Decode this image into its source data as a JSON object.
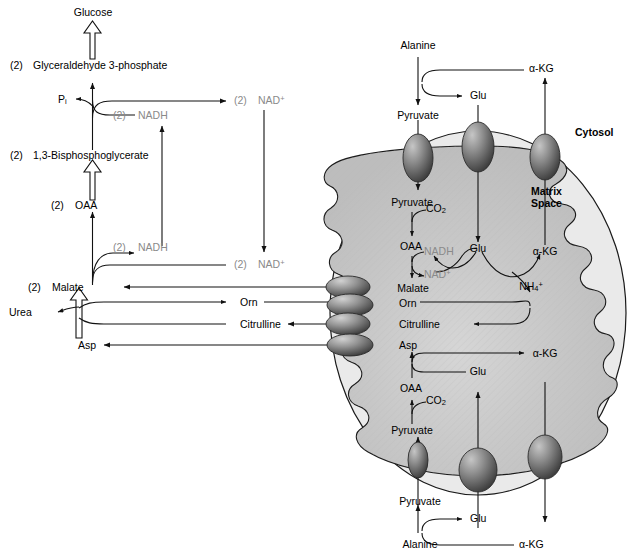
{
  "diagram": {
    "compartments": {
      "cytosol_label": "Cytosol",
      "matrix_label_line1": "Matrix",
      "matrix_label_line2": "Space"
    },
    "colors": {
      "outline": "#1a1a1a",
      "outer_membrane_fill": "#e8e8e8",
      "matrix_fill": "#c9c9c9",
      "transporter_dark": "#4a4a4a",
      "transporter_light": "#d8d8d8",
      "cofactor_gray": "#8a8a8a",
      "text": "#000000",
      "background": "#ffffff"
    },
    "stoich_prefix": "(2)",
    "cytosol_pathway": {
      "name": "Gluconeogenesis",
      "metabolites": [
        {
          "id": "glucose",
          "label": "Glucose"
        },
        {
          "id": "gap",
          "label": "Glyceraldehyde 3-phosphate",
          "prefix": "(2)"
        },
        {
          "id": "bpg",
          "label": "1,3-Bisphosphoglycerate",
          "prefix": "(2)"
        },
        {
          "id": "oaa_cyt",
          "label": "OAA",
          "prefix": "(2)"
        },
        {
          "id": "malate_cyt",
          "label": "Malate",
          "prefix": "(2)"
        },
        {
          "id": "asp_cyt",
          "label": "Asp"
        },
        {
          "id": "urea",
          "label": "Urea"
        },
        {
          "id": "orn_cyt",
          "label": "Orn"
        },
        {
          "id": "citr_cyt",
          "label": "Citrulline"
        }
      ],
      "cofactors": [
        {
          "id": "pi",
          "label": "P",
          "subscript": "i"
        },
        {
          "id": "nadh_top",
          "label": "NADH",
          "prefix": "(2)",
          "color": "gray"
        },
        {
          "id": "nad_top",
          "label": "NAD",
          "superscript": "+",
          "prefix": "(2)",
          "color": "gray"
        },
        {
          "id": "nadh_bot",
          "label": "NADH",
          "prefix": "(2)",
          "color": "gray"
        },
        {
          "id": "nad_bot",
          "label": "NAD",
          "superscript": "+",
          "prefix": "(2)",
          "color": "gray"
        }
      ]
    },
    "cytosol_right": {
      "top": [
        {
          "id": "alanine_top",
          "label": "Alanine"
        },
        {
          "id": "pyruvate_top_cyt",
          "label": "Pyruvate"
        },
        {
          "id": "glu_top_cyt",
          "label": "Glu"
        },
        {
          "id": "akg_top_cyt",
          "label": "α-KG"
        }
      ],
      "bottom": [
        {
          "id": "alanine_bot",
          "label": "Alanine"
        },
        {
          "id": "pyruvate_bot_cyt",
          "label": "Pyruvate"
        },
        {
          "id": "glu_bot_cyt",
          "label": "Glu"
        },
        {
          "id": "akg_bot_cyt",
          "label": "α-KG"
        }
      ]
    },
    "matrix": {
      "upper": [
        {
          "id": "pyruvate_mit_top",
          "label": "Pyruvate"
        },
        {
          "id": "co2_top",
          "label": "CO",
          "subscript": "2"
        },
        {
          "id": "oaa_mit_top",
          "label": "OAA"
        },
        {
          "id": "nadh_mit",
          "label": "NADH",
          "color": "gray"
        },
        {
          "id": "nad_mit",
          "label": "NAD",
          "superscript": "+",
          "color": "gray"
        },
        {
          "id": "malate_mit",
          "label": "Malate"
        },
        {
          "id": "glu_mit_top",
          "label": "Glu"
        },
        {
          "id": "akg_mit_top",
          "label": "α-KG"
        },
        {
          "id": "nh4_mit",
          "label": "NH",
          "subscript": "4",
          "superscript": "+"
        }
      ],
      "transport": [
        {
          "id": "orn_mit",
          "label": "Orn"
        },
        {
          "id": "citr_mit",
          "label": "Citrulline"
        },
        {
          "id": "asp_mit",
          "label": "Asp"
        }
      ],
      "lower": [
        {
          "id": "akg_mit_bot",
          "label": "α-KG"
        },
        {
          "id": "glu_mit_bot",
          "label": "Glu"
        },
        {
          "id": "oaa_mit_bot",
          "label": "OAA"
        },
        {
          "id": "co2_bot",
          "label": "CO",
          "subscript": "2"
        },
        {
          "id": "pyruvate_mit_bot",
          "label": "Pyruvate"
        }
      ]
    },
    "transporters": [
      {
        "id": "pyruvate-carrier-top",
        "shape": "vertical-oval"
      },
      {
        "id": "glu-carrier-top",
        "shape": "vertical-oval"
      },
      {
        "id": "akg-carrier-top",
        "shape": "vertical-oval"
      },
      {
        "id": "malate-carrier",
        "shape": "horizontal-oval"
      },
      {
        "id": "ornithine-carrier",
        "shape": "horizontal-oval"
      },
      {
        "id": "citrulline-carrier",
        "shape": "horizontal-oval"
      },
      {
        "id": "aspartate-carrier",
        "shape": "horizontal-oval"
      },
      {
        "id": "pyruvate-carrier-bottom",
        "shape": "vertical-oval"
      },
      {
        "id": "glu-carrier-bottom",
        "shape": "vertical-oval"
      },
      {
        "id": "akg-carrier-bottom",
        "shape": "vertical-oval"
      }
    ]
  }
}
